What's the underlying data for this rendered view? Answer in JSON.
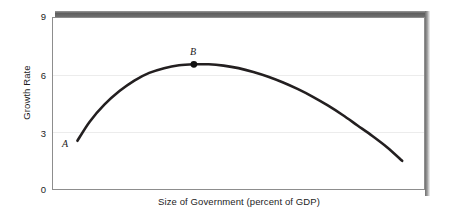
{
  "figure": {
    "background_color": "#ffffff",
    "frame_color": "#8d8d8d",
    "curve_color": "#231f20",
    "gridline_color": "#ececec",
    "shadow_color": "#6f6f6f"
  },
  "axes": {
    "y_title": "Growth Rate",
    "x_title": "Size of Government (percent of GDP)",
    "y_ticks": [
      "9",
      "6",
      "3",
      "0"
    ]
  },
  "annotations": {
    "point_a_label": "A",
    "point_b_label": "B"
  },
  "artifacts": {
    "bleed_text": "—  — — ————— ——  —  —"
  },
  "chart_data": {
    "type": "line",
    "title": "",
    "subtitle": "",
    "xlabel": "Size of Government (percent of GDP)",
    "ylabel": "Growth Rate",
    "xlim": [
      0,
      100
    ],
    "ylim": [
      0,
      9
    ],
    "yticks": [
      0,
      3,
      6,
      9
    ],
    "ytick_labels": [
      "0",
      "3",
      "6",
      "9"
    ],
    "xticks": [],
    "xtick_labels": [],
    "grid": true,
    "grid_axis": "y",
    "legend": false,
    "legend_position": "none",
    "series": [
      {
        "name": "Growth Rate vs Size of Government",
        "x": [
          6.7,
          10,
          14,
          18,
          22,
          26,
          30,
          34,
          38,
          42,
          46,
          50,
          54,
          58,
          62,
          66,
          70,
          74,
          78,
          82,
          86,
          90,
          94
        ],
        "y": [
          2.55,
          3.55,
          4.45,
          5.15,
          5.7,
          6.1,
          6.35,
          6.5,
          6.55,
          6.55,
          6.48,
          6.35,
          6.15,
          5.9,
          5.6,
          5.25,
          4.85,
          4.4,
          3.9,
          3.35,
          2.8,
          2.2,
          1.5
        ]
      }
    ],
    "annotations": [
      {
        "label": "A",
        "x": 6.7,
        "y": 2.55,
        "marker": false,
        "label_position": "left"
      },
      {
        "label": "B",
        "x": 38,
        "y": 6.55,
        "marker": true,
        "label_position": "above"
      }
    ]
  }
}
